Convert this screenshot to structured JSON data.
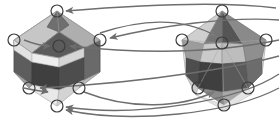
{
  "figure": {
    "title": "",
    "caption": "",
    "background_color": "#ffffff",
    "width": 280,
    "height": 127,
    "domain_type": "geometric-diagram"
  },
  "palette": {
    "outline": "#4a4a4a",
    "arrow": "#6e6e6e",
    "vertex_ring": "#3c3c3c",
    "vertex_fill": "none",
    "face_darkest": "#3f3f3f",
    "face_dark": "#5a5a5a",
    "face_mid_dark": "#6f6f6f",
    "face_mid": "#8c8c8c",
    "face_light": "#b4b4b4",
    "face_lighter": "#cfcfcf",
    "face_lightest": "#e6e6e6",
    "face_white": "#f4f4f4",
    "edge_thin": "#9a9a9a"
  },
  "objects": {
    "left_solid": {
      "name": "left-polyhedron",
      "label": "",
      "center": {
        "x": 57,
        "y": 55
      },
      "vertices": [
        {
          "id": "L1",
          "label": "",
          "x": 57,
          "y": 11
        },
        {
          "id": "L2",
          "label": "",
          "x": 14,
          "y": 40
        },
        {
          "id": "L3",
          "label": "",
          "x": 100,
          "y": 40
        },
        {
          "id": "L4",
          "label": "",
          "x": 59,
          "y": 46
        },
        {
          "id": "L5",
          "label": "",
          "x": 29,
          "y": 88
        },
        {
          "id": "L6",
          "label": "",
          "x": 79,
          "y": 88
        },
        {
          "id": "L7",
          "label": "",
          "x": 57,
          "y": 106
        }
      ]
    },
    "right_solid": {
      "name": "right-polyhedron",
      "label": "",
      "center": {
        "x": 224,
        "y": 55
      },
      "vertices": [
        {
          "id": "R1",
          "label": "",
          "x": 222,
          "y": 11
        },
        {
          "id": "R2",
          "label": "",
          "x": 182,
          "y": 40
        },
        {
          "id": "R3",
          "label": "",
          "x": 266,
          "y": 40
        },
        {
          "id": "R4",
          "label": "",
          "x": 222,
          "y": 43
        },
        {
          "id": "R5",
          "label": "",
          "x": 198,
          "y": 88
        },
        {
          "id": "R6",
          "label": "",
          "x": 248,
          "y": 88
        },
        {
          "id": "R7",
          "label": "",
          "x": 224,
          "y": 105
        }
      ]
    }
  },
  "arrows": [
    {
      "id": "A1",
      "label": "",
      "from": "R1",
      "to": "L1",
      "direction": "right-to-left"
    },
    {
      "id": "A2",
      "label": "",
      "from": "R2",
      "to": "L3",
      "direction": "right-to-left"
    },
    {
      "id": "A3",
      "label": "",
      "from": "R4",
      "to": "L4",
      "direction": "right-to-left"
    },
    {
      "id": "A4",
      "label": "",
      "from": "L3",
      "to": "R2",
      "direction": "left-to-right"
    },
    {
      "id": "A5",
      "label": "",
      "from": "R5",
      "to": "L6",
      "direction": "right-to-left"
    },
    {
      "id": "A6",
      "label": "",
      "from": "L6",
      "to": "R5",
      "direction": "left-to-right"
    },
    {
      "id": "A7",
      "label": "",
      "from": "R7",
      "to": "L7",
      "direction": "right-to-left"
    },
    {
      "id": "A8",
      "label": "",
      "from": "L2",
      "to": "L4",
      "direction": "left-inner"
    }
  ],
  "vertex_marker": {
    "radius": 6,
    "stroke_width": 1.2,
    "style": "open-circle"
  }
}
